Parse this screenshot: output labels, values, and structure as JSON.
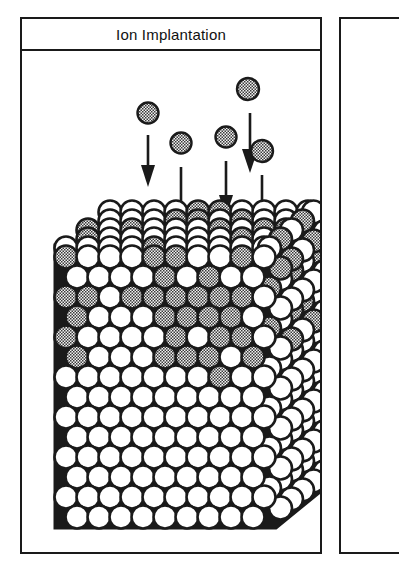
{
  "figure": {
    "title": "Ion Implantation",
    "caption_text": "Ion Implantation",
    "background_color": "#ffffff",
    "ink_color": "#1a1a1a"
  },
  "panel": {
    "title": "Ion Implantation",
    "border_color": "#1a1a1a",
    "fill_color": "#ffffff"
  },
  "adjacent_panel": {
    "label": "",
    "border_color": "#1a1a1a"
  },
  "legend": {
    "host_atom_label": "host lattice atom",
    "host_atom_color": "#ffffff",
    "implanted_atom_label": "implanted ion",
    "implanted_atom_color": "#8a8a8a",
    "outline_color": "#1a1a1a"
  },
  "beam": {
    "direction_label": "downward",
    "arrow_color": "#1a1a1a",
    "ion_radius": 10.5,
    "ions": [
      {
        "id": "ion-1",
        "cx": 126,
        "cy": 62,
        "arrow_x": 126,
        "arrow_y1": 84,
        "arrow_y2": 134
      },
      {
        "id": "ion-2",
        "cx": 159,
        "cy": 90,
        "arrow_x": 159,
        "arrow_y1": 112,
        "arrow_y2": 178
      },
      {
        "id": "ion-3",
        "cx": 204,
        "cy": 84,
        "arrow_x": 204,
        "arrow_y1": 106,
        "arrow_y2": 162
      },
      {
        "id": "ion-4",
        "cx": 224,
        "cy": 38,
        "arrow_x": 228,
        "arrow_y1": 60,
        "arrow_y2": 122
      },
      {
        "id": "ion-5",
        "cx": 237,
        "cy": 98,
        "arrow_x": 237,
        "arrow_y1": 120,
        "arrow_y2": 190
      }
    ]
  },
  "crystal": {
    "description_label": "crystal lattice cross-section",
    "top_face_label": "top surface",
    "right_face_label": "side face",
    "atom_radius": 11.5,
    "row_pitch": 20,
    "col_pitch": 22,
    "front_rows": 14,
    "front_cols": 10,
    "damaged_region_label": "implanted / damaged region",
    "undamaged_region_label": "undamaged substrate",
    "implanted_rows_depth": 8
  },
  "chart_data": {
    "type": "diagram",
    "title": "Ion Implantation",
    "xlabel": "",
    "ylabel": "",
    "annotations": [
      "Energetic ions arrive from above along parallel downward trajectories.",
      "Ions penetrate the crystal surface and come to rest in the near-surface region.",
      "The upper lattice layers contain many implanted (shaded) atoms intermixed with host atoms.",
      "The deeper lattice layers remain entirely host atoms and are undamaged."
    ],
    "series": [
      {
        "name": "incident ions",
        "values": [
          5
        ]
      },
      {
        "name": "implanted atoms in lattice",
        "values": [
          34
        ]
      },
      {
        "name": "host lattice atoms",
        "values": [
          150
        ]
      }
    ]
  }
}
